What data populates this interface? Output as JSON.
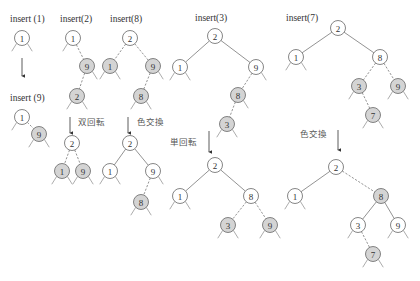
{
  "colors": {
    "black_node_fill": "#ffffff",
    "red_node_fill": "#d4d4d4",
    "stroke": "#666666",
    "text": "#333333"
  },
  "legend": {
    "filled_gray_node": "red node",
    "white_node": "black node",
    "dashed_edge": "edge to red node",
    "solid_edge": "edge to black node"
  },
  "panels": [
    {
      "id": "p1",
      "label": "insert (1)",
      "label_pos": [
        10,
        22
      ],
      "nodes": [
        {
          "key": "1",
          "x": 22,
          "y": 38,
          "red": false
        }
      ],
      "edges": []
    },
    {
      "id": "p2",
      "label": "insert (9)",
      "label_pos": [
        10,
        101
      ],
      "nodes": [
        {
          "key": "1",
          "x": 22,
          "y": 117,
          "red": false
        },
        {
          "key": "9",
          "x": 39,
          "y": 134,
          "red": true
        }
      ],
      "edges": [
        [
          0,
          1
        ]
      ]
    },
    {
      "id": "p3",
      "label": "insert(2)",
      "label_pos": [
        60,
        22
      ],
      "nodes": [
        {
          "key": "1",
          "x": 73,
          "y": 38,
          "red": false
        },
        {
          "key": "9",
          "x": 87,
          "y": 66,
          "red": true
        },
        {
          "key": "2",
          "x": 77,
          "y": 96,
          "red": true
        }
      ],
      "edges": [
        [
          0,
          1
        ],
        [
          1,
          2
        ]
      ]
    },
    {
      "id": "p4",
      "label": "",
      "transition": "双回転",
      "transition_pos": [
        78,
        125
      ],
      "arrow": [
        70,
        117,
        70,
        133
      ],
      "nodes": [
        {
          "key": "2",
          "x": 72,
          "y": 143,
          "red": false
        },
        {
          "key": "1",
          "x": 62,
          "y": 171,
          "red": true
        },
        {
          "key": "9",
          "x": 83,
          "y": 171,
          "red": true
        }
      ],
      "edges": [
        [
          0,
          1
        ],
        [
          0,
          2
        ]
      ]
    },
    {
      "id": "p5",
      "label": "insert(8)",
      "label_pos": [
        110,
        22
      ],
      "nodes": [
        {
          "key": "2",
          "x": 130,
          "y": 38,
          "red": false
        },
        {
          "key": "1",
          "x": 110,
          "y": 66,
          "red": true
        },
        {
          "key": "9",
          "x": 153,
          "y": 66,
          "red": true
        },
        {
          "key": "8",
          "x": 141,
          "y": 96,
          "red": true
        }
      ],
      "edges": [
        [
          0,
          1
        ],
        [
          0,
          2
        ],
        [
          2,
          3
        ]
      ]
    },
    {
      "id": "p6",
      "label": "",
      "transition": "色交換",
      "transition_pos": [
        137,
        125
      ],
      "arrow": [
        128,
        117,
        128,
        133
      ],
      "nodes": [
        {
          "key": "2",
          "x": 130,
          "y": 143,
          "red": false
        },
        {
          "key": "1",
          "x": 110,
          "y": 171,
          "red": false
        },
        {
          "key": "9",
          "x": 153,
          "y": 171,
          "red": false
        },
        {
          "key": "8",
          "x": 141,
          "y": 202,
          "red": true
        }
      ],
      "edges": [
        [
          0,
          1
        ],
        [
          0,
          2
        ],
        [
          2,
          3
        ]
      ]
    },
    {
      "id": "p7",
      "label": "insert(3)",
      "label_pos": [
        195,
        21
      ],
      "nodes": [
        {
          "key": "2",
          "x": 215,
          "y": 36,
          "red": false
        },
        {
          "key": "1",
          "x": 180,
          "y": 67,
          "red": false
        },
        {
          "key": "9",
          "x": 256,
          "y": 67,
          "red": false
        },
        {
          "key": "8",
          "x": 238,
          "y": 95,
          "red": true
        },
        {
          "key": "3",
          "x": 227,
          "y": 124,
          "red": true
        }
      ],
      "edges": [
        [
          0,
          1
        ],
        [
          0,
          2
        ],
        [
          2,
          3
        ],
        [
          3,
          4
        ]
      ]
    },
    {
      "id": "p8",
      "label": "",
      "transition": "単回転",
      "transition_pos": [
        170,
        145
      ],
      "arrow": [
        209,
        131,
        209,
        152
      ],
      "nodes": [
        {
          "key": "2",
          "x": 215,
          "y": 165,
          "red": false
        },
        {
          "key": "1",
          "x": 180,
          "y": 196,
          "red": false
        },
        {
          "key": "8",
          "x": 251,
          "y": 196,
          "red": false
        },
        {
          "key": "3",
          "x": 228,
          "y": 225,
          "red": true
        },
        {
          "key": "9",
          "x": 270,
          "y": 225,
          "red": true
        }
      ],
      "edges": [
        [
          0,
          1
        ],
        [
          0,
          2
        ],
        [
          2,
          3
        ],
        [
          2,
          4
        ]
      ]
    },
    {
      "id": "p9",
      "label": "insert(7)",
      "label_pos": [
        286,
        21
      ],
      "nodes": [
        {
          "key": "2",
          "x": 338,
          "y": 28,
          "red": false
        },
        {
          "key": "1",
          "x": 296,
          "y": 57,
          "red": false
        },
        {
          "key": "8",
          "x": 380,
          "y": 57,
          "red": false
        },
        {
          "key": "3",
          "x": 359,
          "y": 86,
          "red": true
        },
        {
          "key": "9",
          "x": 398,
          "y": 86,
          "red": true
        },
        {
          "key": "7",
          "x": 373,
          "y": 115,
          "red": true
        }
      ],
      "edges": [
        [
          0,
          1
        ],
        [
          0,
          2
        ],
        [
          2,
          3
        ],
        [
          2,
          4
        ],
        [
          3,
          5
        ]
      ]
    },
    {
      "id": "p10",
      "label": "",
      "transition": "色交換",
      "transition_pos": [
        300,
        137
      ],
      "arrow": [
        338,
        130,
        338,
        150
      ],
      "nodes": [
        {
          "key": "2",
          "x": 336,
          "y": 167,
          "red": false
        },
        {
          "key": "1",
          "x": 295,
          "y": 196,
          "red": false
        },
        {
          "key": "8",
          "x": 381,
          "y": 196,
          "red": true
        },
        {
          "key": "3",
          "x": 358,
          "y": 225,
          "red": false
        },
        {
          "key": "9",
          "x": 398,
          "y": 225,
          "red": false
        },
        {
          "key": "7",
          "x": 373,
          "y": 254,
          "red": true
        }
      ],
      "edges": [
        [
          0,
          1
        ],
        [
          0,
          2
        ],
        [
          2,
          3
        ],
        [
          2,
          4
        ],
        [
          3,
          5
        ]
      ]
    }
  ],
  "down_arrows": [
    {
      "x1": 22,
      "y1": 58,
      "x2": 22,
      "y2": 76
    }
  ]
}
